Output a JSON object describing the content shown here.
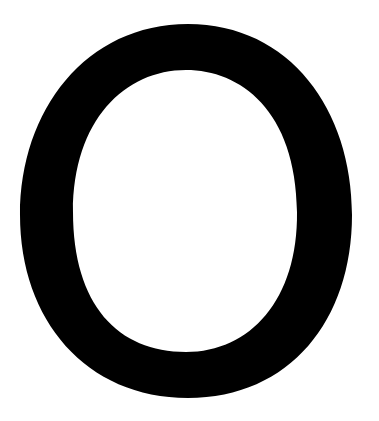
{
  "glyph": {
    "character": "O",
    "fill_color": "#000000",
    "background_color": "#ffffff"
  }
}
